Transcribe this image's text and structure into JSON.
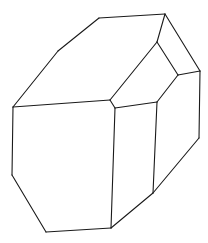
{
  "diagram": {
    "stroke_color": "#1a1a1a",
    "background": "#ffffff",
    "vertices": {
      "A": [
        99,
        18
      ],
      "B": [
        165,
        14
      ],
      "C": [
        58,
        51
      ],
      "D": [
        13,
        107
      ],
      "E": [
        157,
        42
      ],
      "F": [
        200,
        71
      ],
      "G": [
        178,
        75
      ],
      "H": [
        110,
        100
      ],
      "I": [
        115,
        108
      ],
      "J": [
        157,
        102
      ],
      "K": [
        12,
        175
      ],
      "L": [
        46,
        232
      ],
      "M": [
        111,
        228
      ],
      "N": [
        153,
        193
      ],
      "O": [
        199,
        138
      ]
    },
    "edges": [
      [
        "A",
        "B"
      ],
      [
        "A",
        "C"
      ],
      [
        "C",
        "D"
      ],
      [
        "B",
        "E"
      ],
      [
        "B",
        "F"
      ],
      [
        "E",
        "G"
      ],
      [
        "E",
        "H"
      ],
      [
        "G",
        "F"
      ],
      [
        "G",
        "J"
      ],
      [
        "H",
        "I"
      ],
      [
        "H",
        "D"
      ],
      [
        "I",
        "J"
      ],
      [
        "D",
        "K"
      ],
      [
        "K",
        "L"
      ],
      [
        "L",
        "M"
      ],
      [
        "I",
        "M"
      ],
      [
        "J",
        "N"
      ],
      [
        "M",
        "N"
      ],
      [
        "N",
        "O"
      ],
      [
        "F",
        "O"
      ]
    ]
  }
}
